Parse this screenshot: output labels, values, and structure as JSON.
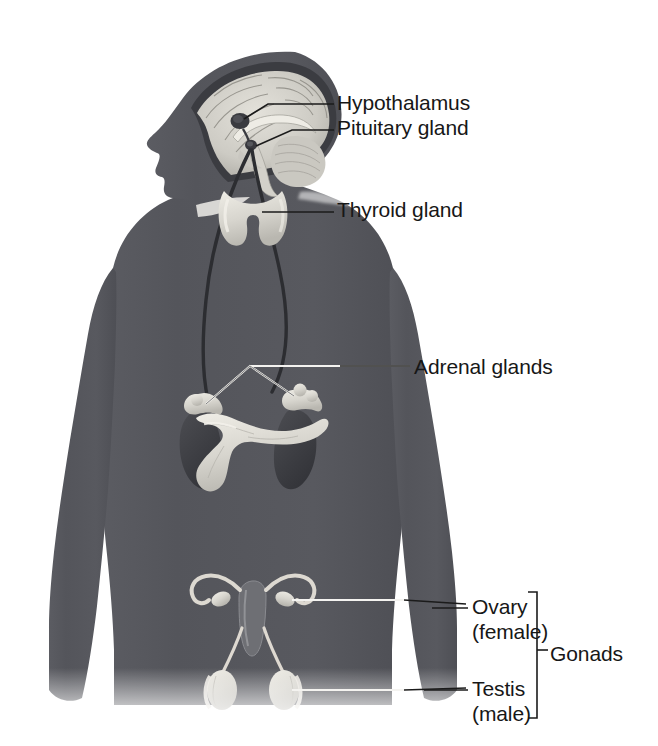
{
  "figure": {
    "background_color": "#ffffff",
    "body_color": "#55565c",
    "organ_color": "#d8d6cf",
    "text_color": "#171717",
    "leader_line_color": "#222222"
  },
  "labels": [
    {
      "id": "hypothalamus",
      "text": "Hypothalamus",
      "x": 337,
      "y": 90,
      "target": "brain-hypothalamus"
    },
    {
      "id": "pituitary",
      "text": "Pituitary gland",
      "x": 337,
      "y": 115,
      "target": "brain-pituitary"
    },
    {
      "id": "thyroid",
      "text": "Thyroid gland",
      "x": 337,
      "y": 197,
      "target": "neck-thyroid"
    },
    {
      "id": "adrenal",
      "text": "Adrenal glands",
      "x": 414,
      "y": 354,
      "target": "abdomen-adrenals"
    },
    {
      "id": "ovary_line1",
      "text": "Ovary",
      "x": 472,
      "y": 594,
      "target": "pelvis-ovary"
    },
    {
      "id": "ovary_line2",
      "text": "(female)",
      "x": 472,
      "y": 619,
      "target": "pelvis-ovary"
    },
    {
      "id": "testis_line1",
      "text": "Testis",
      "x": 472,
      "y": 676,
      "target": "pelvis-testis"
    },
    {
      "id": "testis_line2",
      "text": "(male)",
      "x": 472,
      "y": 701,
      "target": "pelvis-testis"
    },
    {
      "id": "gonads",
      "text": "Gonads",
      "x": 550,
      "y": 641,
      "target": "gonads-bracket"
    }
  ],
  "structures": [
    {
      "id": "brain",
      "name": "Brain (midsagittal section)"
    },
    {
      "id": "brain-hypothalamus",
      "name": "Hypothalamus"
    },
    {
      "id": "brain-pituitary",
      "name": "Pituitary gland"
    },
    {
      "id": "neck-thyroid",
      "name": "Thyroid gland"
    },
    {
      "id": "abdomen-adrenals",
      "name": "Adrenal glands"
    },
    {
      "id": "abdomen-kidneys",
      "name": "Kidneys"
    },
    {
      "id": "abdomen-pancreas",
      "name": "Pancreas"
    },
    {
      "id": "pelvis-uterus",
      "name": "Uterus and fallopian tubes"
    },
    {
      "id": "pelvis-ovary",
      "name": "Ovaries"
    },
    {
      "id": "pelvis-testis",
      "name": "Testes"
    }
  ]
}
